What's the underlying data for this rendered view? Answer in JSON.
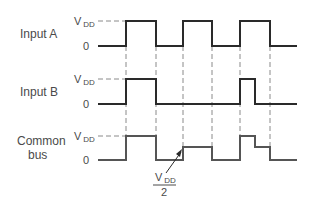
{
  "diagram": {
    "type": "timing-diagram",
    "signals": [
      {
        "name": "input-a",
        "label": "Input A",
        "high_label": "V",
        "high_sub": "DD",
        "low_label": "0"
      },
      {
        "name": "input-b",
        "label": "Input B",
        "high_label": "V",
        "high_sub": "DD",
        "low_label": "0"
      },
      {
        "name": "common-bus",
        "label_line1": "Common",
        "label_line2": "bus",
        "high_label": "V",
        "high_sub": "DD",
        "low_label": "0"
      }
    ],
    "annotation": {
      "numerator": "V",
      "numerator_sub": "DD",
      "denominator": "2"
    },
    "colors": {
      "signal": "#2a2a2a",
      "dash": "#8a8a8a",
      "text": "#4a4a4a"
    }
  }
}
